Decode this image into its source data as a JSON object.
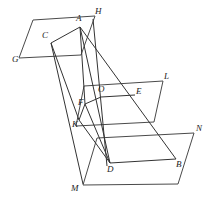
{
  "figure": {
    "type": "geometric-diagram",
    "width": 215,
    "height": 207,
    "background_color": "#ffffff",
    "stroke_color": "#333333",
    "plane_stroke_color": "#4a4a4a"
  },
  "labels": {
    "A": "A",
    "B": "B",
    "C": "C",
    "D": "D",
    "E": "E",
    "F": "F",
    "G": "G",
    "H": "H",
    "K": "K",
    "L": "L",
    "M": "M",
    "N": "N",
    "O": "O"
  },
  "points": {
    "A": {
      "x": 80,
      "y": 27
    },
    "B": {
      "x": 176,
      "y": 159
    },
    "C": {
      "x": 51,
      "y": 43
    },
    "D": {
      "x": 110,
      "y": 163
    },
    "E": {
      "x": 135,
      "y": 95
    },
    "F": {
      "x": 85,
      "y": 104
    },
    "G": {
      "x": 19,
      "y": 58
    },
    "H": {
      "x": 95,
      "y": 19
    },
    "K": {
      "x": 79,
      "y": 120
    },
    "L": {
      "x": 163,
      "y": 81
    },
    "M": {
      "x": 83,
      "y": 184
    },
    "N": {
      "x": 194,
      "y": 133
    },
    "O": {
      "x": 101,
      "y": 97
    }
  },
  "label_positions": {
    "A": {
      "x": 76,
      "y": 14
    },
    "B": {
      "x": 176,
      "y": 160
    },
    "C": {
      "x": 42,
      "y": 31
    },
    "D": {
      "x": 107,
      "y": 165
    },
    "E": {
      "x": 136,
      "y": 87
    },
    "F": {
      "x": 78,
      "y": 98
    },
    "G": {
      "x": 12,
      "y": 55
    },
    "H": {
      "x": 95,
      "y": 7
    },
    "K": {
      "x": 72,
      "y": 120
    },
    "L": {
      "x": 164,
      "y": 72
    },
    "M": {
      "x": 71,
      "y": 184
    },
    "N": {
      "x": 196,
      "y": 124
    },
    "O": {
      "x": 98,
      "y": 85
    }
  },
  "planes": [
    {
      "name": "top-plane-GH",
      "vertices": "33,20 95,16 81,55 19,58",
      "corner_labels": [
        "G",
        "H"
      ]
    },
    {
      "name": "middle-plane-KL",
      "vertices": "84,86 163,81 154,122 76,126",
      "corner_labels": [
        "K",
        "L"
      ]
    },
    {
      "name": "bottom-plane-MN",
      "vertices": "97,138 194,133 178,184 83,185",
      "corner_labels": [
        "M",
        "N"
      ]
    }
  ],
  "solid_edges": [
    {
      "name": "edge-A-C",
      "from": "A",
      "to": "C"
    },
    {
      "name": "edge-C-K",
      "from": "C",
      "to": "K"
    },
    {
      "name": "edge-K-F",
      "from": "K",
      "to": "F"
    },
    {
      "name": "edge-F-A",
      "from": "F",
      "to": "A"
    },
    {
      "name": "edge-F-O",
      "from": "F",
      "to": "O"
    },
    {
      "name": "edge-O-E",
      "from": "O",
      "to": "E"
    },
    {
      "name": "edge-D-B",
      "from": "D",
      "to": "B"
    },
    {
      "name": "edge-K-D",
      "from": "K",
      "to": "D"
    },
    {
      "name": "edge-F-D",
      "from": "F",
      "to": "D"
    }
  ],
  "rays": [
    {
      "name": "ray-A-to-B",
      "from": "A",
      "to": "B"
    },
    {
      "name": "ray-A-to-D",
      "from": "A",
      "to": "D"
    },
    {
      "name": "ray-H-to-D",
      "from": "H",
      "to": "D"
    },
    {
      "name": "ray-C-through-F-to-M",
      "from": "C",
      "to": "M"
    }
  ]
}
